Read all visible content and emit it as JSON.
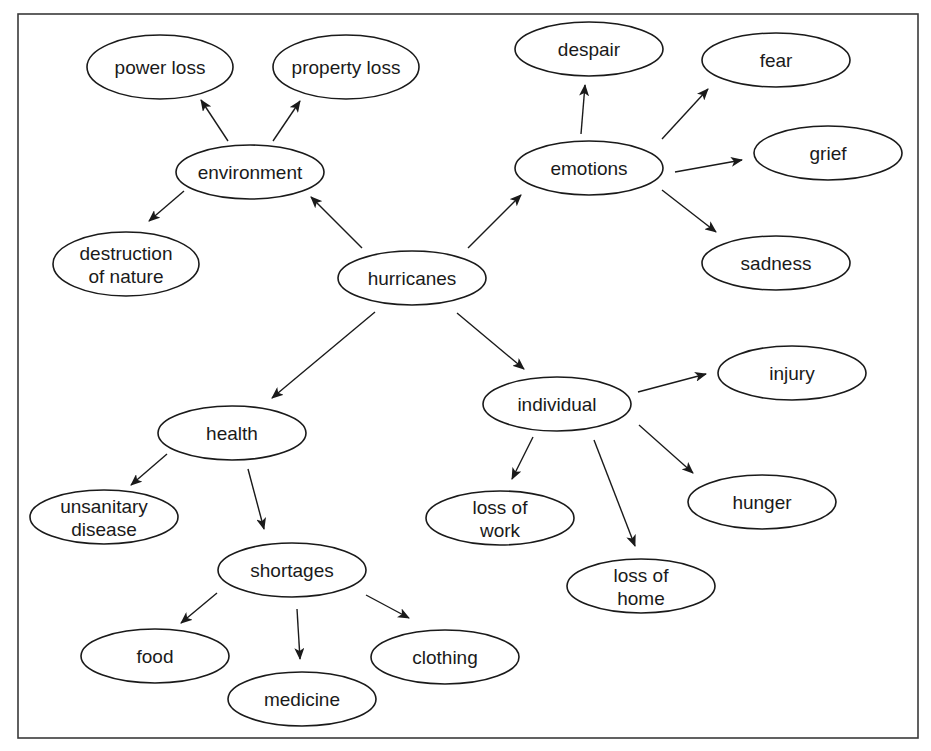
{
  "diagram": {
    "colors": {
      "stroke": "#1a1a1a",
      "background": "#ffffff",
      "frame": "#3a3a3a"
    },
    "frame": {
      "x": 18,
      "y": 14,
      "w": 900,
      "h": 426
    },
    "nodes": [
      {
        "id": "hurricanes",
        "lines": [
          "hurricanes"
        ],
        "cx": 412,
        "cy": 278,
        "rx": 74,
        "ry": 27
      },
      {
        "id": "environment",
        "lines": [
          "environment"
        ],
        "cx": 250,
        "cy": 172,
        "rx": 74,
        "ry": 27
      },
      {
        "id": "power-loss",
        "lines": [
          "power loss"
        ],
        "cx": 160,
        "cy": 67,
        "rx": 73,
        "ry": 32
      },
      {
        "id": "property-loss",
        "lines": [
          "property loss"
        ],
        "cx": 346,
        "cy": 67,
        "rx": 73,
        "ry": 32
      },
      {
        "id": "destruction-of-nature",
        "lines": [
          "destruction",
          "of nature"
        ],
        "cx": 126,
        "cy": 264,
        "rx": 73,
        "ry": 32
      },
      {
        "id": "emotions",
        "lines": [
          "emotions"
        ],
        "cx": 589,
        "cy": 168,
        "rx": 74,
        "ry": 27
      },
      {
        "id": "despair",
        "lines": [
          "despair"
        ],
        "cx": 589,
        "cy": 49,
        "rx": 74,
        "ry": 27
      },
      {
        "id": "fear",
        "lines": [
          "fear"
        ],
        "cx": 776,
        "cy": 60,
        "rx": 74,
        "ry": 27
      },
      {
        "id": "grief",
        "lines": [
          "grief"
        ],
        "cx": 828,
        "cy": 153,
        "rx": 74,
        "ry": 27
      },
      {
        "id": "sadness",
        "lines": [
          "sadness"
        ],
        "cx": 776,
        "cy": 263,
        "rx": 74,
        "ry": 27
      },
      {
        "id": "health",
        "lines": [
          "health"
        ],
        "cx": 232,
        "cy": 433,
        "rx": 74,
        "ry": 27
      },
      {
        "id": "unsanitary-disease",
        "lines": [
          "unsanitary",
          "disease"
        ],
        "cx": 104,
        "cy": 517,
        "rx": 74,
        "ry": 27
      },
      {
        "id": "shortages",
        "lines": [
          "shortages"
        ],
        "cx": 292,
        "cy": 570,
        "rx": 74,
        "ry": 27
      },
      {
        "id": "food",
        "lines": [
          "food"
        ],
        "cx": 155,
        "cy": 656,
        "rx": 74,
        "ry": 27
      },
      {
        "id": "medicine",
        "lines": [
          "medicine"
        ],
        "cx": 302,
        "cy": 699,
        "rx": 74,
        "ry": 27
      },
      {
        "id": "clothing",
        "lines": [
          "clothing"
        ],
        "cx": 445,
        "cy": 657,
        "rx": 74,
        "ry": 27
      },
      {
        "id": "individual",
        "lines": [
          "individual"
        ],
        "cx": 557,
        "cy": 404,
        "rx": 74,
        "ry": 27
      },
      {
        "id": "injury",
        "lines": [
          "injury"
        ],
        "cx": 792,
        "cy": 373,
        "rx": 74,
        "ry": 27
      },
      {
        "id": "hunger",
        "lines": [
          "hunger"
        ],
        "cx": 762,
        "cy": 502,
        "rx": 74,
        "ry": 27
      },
      {
        "id": "loss-of-work",
        "lines": [
          "loss of",
          "work"
        ],
        "cx": 500,
        "cy": 518,
        "rx": 74,
        "ry": 27
      },
      {
        "id": "loss-of-home",
        "lines": [
          "loss of",
          "home"
        ],
        "cx": 641,
        "cy": 586,
        "rx": 74,
        "ry": 27
      }
    ],
    "edges": [
      {
        "from": "hurricanes",
        "to": "environment",
        "x1": 362,
        "y1": 248,
        "x2": 311,
        "y2": 197
      },
      {
        "from": "hurricanes",
        "to": "emotions",
        "x1": 468,
        "y1": 248,
        "x2": 521,
        "y2": 195
      },
      {
        "from": "hurricanes",
        "to": "health",
        "x1": 375,
        "y1": 312,
        "x2": 272,
        "y2": 398
      },
      {
        "from": "hurricanes",
        "to": "individual",
        "x1": 457,
        "y1": 313,
        "x2": 524,
        "y2": 369
      },
      {
        "from": "environment",
        "to": "power-loss",
        "x1": 228,
        "y1": 141,
        "x2": 201,
        "y2": 100
      },
      {
        "from": "environment",
        "to": "property-loss",
        "x1": 273,
        "y1": 141,
        "x2": 300,
        "y2": 101
      },
      {
        "from": "environment",
        "to": "destruction-of-nature",
        "x1": 184,
        "y1": 191,
        "x2": 149,
        "y2": 221
      },
      {
        "from": "emotions",
        "to": "despair",
        "x1": 581,
        "y1": 134,
        "x2": 585,
        "y2": 85
      },
      {
        "from": "emotions",
        "to": "fear",
        "x1": 662,
        "y1": 139,
        "x2": 708,
        "y2": 89
      },
      {
        "from": "emotions",
        "to": "grief",
        "x1": 675,
        "y1": 172,
        "x2": 742,
        "y2": 160
      },
      {
        "from": "emotions",
        "to": "sadness",
        "x1": 662,
        "y1": 190,
        "x2": 716,
        "y2": 232
      },
      {
        "from": "health",
        "to": "unsanitary-disease",
        "x1": 167,
        "y1": 454,
        "x2": 131,
        "y2": 485
      },
      {
        "from": "health",
        "to": "shortages",
        "x1": 248,
        "y1": 469,
        "x2": 264,
        "y2": 529
      },
      {
        "from": "shortages",
        "to": "food",
        "x1": 217,
        "y1": 593,
        "x2": 181,
        "y2": 623
      },
      {
        "from": "shortages",
        "to": "medicine",
        "x1": 297,
        "y1": 609,
        "x2": 300,
        "y2": 659
      },
      {
        "from": "shortages",
        "to": "clothing",
        "x1": 366,
        "y1": 595,
        "x2": 409,
        "y2": 618
      },
      {
        "from": "individual",
        "to": "injury",
        "x1": 638,
        "y1": 392,
        "x2": 706,
        "y2": 374
      },
      {
        "from": "individual",
        "to": "hunger",
        "x1": 639,
        "y1": 425,
        "x2": 693,
        "y2": 473
      },
      {
        "from": "individual",
        "to": "loss-of-work",
        "x1": 533,
        "y1": 437,
        "x2": 512,
        "y2": 479
      },
      {
        "from": "individual",
        "to": "loss-of-home",
        "x1": 594,
        "y1": 440,
        "x2": 635,
        "y2": 546
      }
    ]
  }
}
